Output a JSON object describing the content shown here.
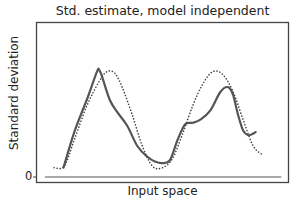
{
  "chart_data": {
    "type": "line",
    "title": "Std. estimate, model independent",
    "xlabel": "Input space",
    "ylabel": "Standard deviation",
    "yticks": [
      "0"
    ],
    "grid": false,
    "legend": null,
    "xlim": [
      0,
      1
    ],
    "ylim": [
      0,
      1
    ],
    "series": [
      {
        "name": "estimate",
        "style": "solid",
        "color": "#555555",
        "x": [
          0.107,
          0.15,
          0.2,
          0.24,
          0.249,
          0.26,
          0.29,
          0.32,
          0.36,
          0.4,
          0.44,
          0.47,
          0.5,
          0.53,
          0.56,
          0.59,
          0.62,
          0.65,
          0.69,
          0.73,
          0.76,
          0.78,
          0.8,
          0.82,
          0.84,
          0.86,
          0.87
        ],
        "y": [
          0.06,
          0.29,
          0.5,
          0.68,
          0.69,
          0.65,
          0.5,
          0.42,
          0.33,
          0.2,
          0.13,
          0.1,
          0.09,
          0.11,
          0.24,
          0.34,
          0.35,
          0.37,
          0.43,
          0.55,
          0.58,
          0.53,
          0.4,
          0.3,
          0.27,
          0.28,
          0.29
        ]
      },
      {
        "name": "model-independent",
        "style": "dotted",
        "color": "#444444",
        "x": [
          0.07,
          0.11,
          0.15,
          0.2,
          0.25,
          0.28,
          0.31,
          0.34,
          0.38,
          0.42,
          0.46,
          0.5,
          0.54,
          0.58,
          0.62,
          0.66,
          0.7,
          0.74,
          0.78,
          0.82,
          0.86,
          0.9
        ],
        "y": [
          0.06,
          0.07,
          0.24,
          0.46,
          0.62,
          0.68,
          0.67,
          0.58,
          0.4,
          0.2,
          0.07,
          0.06,
          0.12,
          0.28,
          0.46,
          0.6,
          0.68,
          0.66,
          0.55,
          0.37,
          0.2,
          0.14
        ]
      },
      {
        "name": "zero-line",
        "style": "solid",
        "color": "#555555",
        "x": [
          0.035,
          0.97
        ],
        "y": [
          0,
          0
        ]
      }
    ]
  }
}
